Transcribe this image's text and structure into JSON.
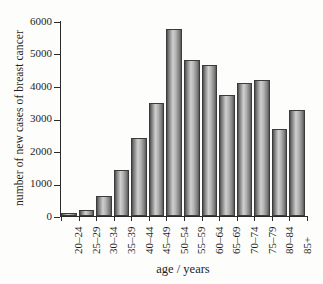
{
  "chart_data": {
    "type": "bar",
    "title": "",
    "subtitle": "",
    "xlabel": "age / years",
    "ylabel": "number of new cases of breast cancer",
    "categories": [
      "20–24",
      "25–29",
      "30–34",
      "35–39",
      "40–44",
      "45–49",
      "50–54",
      "55–59",
      "60–64",
      "65–69",
      "70–74",
      "75–79",
      "80–84",
      "85+"
    ],
    "values": [
      80,
      200,
      630,
      1420,
      2400,
      3490,
      5740,
      4790,
      4650,
      3730,
      4080,
      4180,
      2690,
      3270
    ],
    "ylim": [
      0,
      6000
    ],
    "yticks": [
      0,
      1000,
      2000,
      3000,
      4000,
      5000,
      6000
    ],
    "ytick_labels": [
      "0",
      "1000",
      "2000",
      "3000",
      "4000",
      "5000",
      "6000"
    ],
    "grid": false,
    "legend": "none",
    "bar_color": "#b0b0b0",
    "axis_color": "#2a2a2a"
  }
}
